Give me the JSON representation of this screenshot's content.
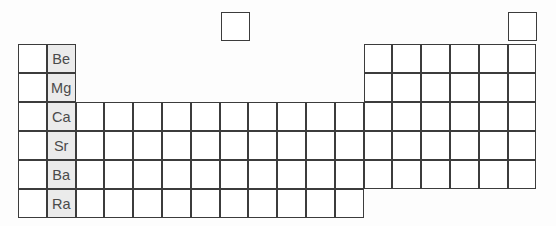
{
  "figure": {
    "kind": "periodic-table-outline",
    "highlighted_group": "Group 2 (alkaline earth metals)",
    "columns": 18,
    "rows": 7
  },
  "geometry": {
    "origin_x": 18,
    "origin_y": 44,
    "cell_w": 28.8,
    "cell_h": 29,
    "hydrogen_x": 221,
    "hydrogen_y": 12,
    "helium_x": 508,
    "helium_y": 12
  },
  "cells": [
    {
      "name": "hydrogen-cell",
      "col": 1,
      "row": 0,
      "x": 221,
      "y": 12,
      "symbol": "",
      "shaded": false
    },
    {
      "name": "helium-cell",
      "col": 18,
      "row": 0,
      "x": 508,
      "y": 12,
      "symbol": "",
      "shaded": false
    },
    {
      "name": "group1-period2",
      "col": 1,
      "row": 1,
      "symbol": "",
      "shaded": false
    },
    {
      "name": "group2-period2",
      "col": 2,
      "row": 1,
      "symbol": "Be",
      "shaded": true
    },
    {
      "name": "group13-period2",
      "col": 13,
      "row": 1,
      "symbol": "",
      "shaded": false
    },
    {
      "name": "group14-period2",
      "col": 14,
      "row": 1,
      "symbol": "",
      "shaded": false
    },
    {
      "name": "group15-period2",
      "col": 15,
      "row": 1,
      "symbol": "",
      "shaded": false
    },
    {
      "name": "group16-period2",
      "col": 16,
      "row": 1,
      "symbol": "",
      "shaded": false
    },
    {
      "name": "group17-period2",
      "col": 17,
      "row": 1,
      "symbol": "",
      "shaded": false
    },
    {
      "name": "group18-period2",
      "col": 18,
      "row": 1,
      "symbol": "",
      "shaded": false
    },
    {
      "name": "group1-period3",
      "col": 1,
      "row": 2,
      "symbol": "",
      "shaded": false
    },
    {
      "name": "group2-period3",
      "col": 2,
      "row": 2,
      "symbol": "Mg",
      "shaded": true
    },
    {
      "name": "group13-period3",
      "col": 13,
      "row": 2,
      "symbol": "",
      "shaded": false
    },
    {
      "name": "group14-period3",
      "col": 14,
      "row": 2,
      "symbol": "",
      "shaded": false
    },
    {
      "name": "group15-period3",
      "col": 15,
      "row": 2,
      "symbol": "",
      "shaded": false
    },
    {
      "name": "group16-period3",
      "col": 16,
      "row": 2,
      "symbol": "",
      "shaded": false
    },
    {
      "name": "group17-period3",
      "col": 17,
      "row": 2,
      "symbol": "",
      "shaded": false
    },
    {
      "name": "group18-period3",
      "col": 18,
      "row": 2,
      "symbol": "",
      "shaded": false
    },
    {
      "name": "group1-period4",
      "col": 1,
      "row": 3,
      "symbol": "",
      "shaded": false
    },
    {
      "name": "group2-period4",
      "col": 2,
      "row": 3,
      "symbol": "Ca",
      "shaded": true
    },
    {
      "name": "group3-period4",
      "col": 3,
      "row": 3,
      "symbol": "",
      "shaded": false
    },
    {
      "name": "group4-period4",
      "col": 4,
      "row": 3,
      "symbol": "",
      "shaded": false
    },
    {
      "name": "group5-period4",
      "col": 5,
      "row": 3,
      "symbol": "",
      "shaded": false
    },
    {
      "name": "group6-period4",
      "col": 6,
      "row": 3,
      "symbol": "",
      "shaded": false
    },
    {
      "name": "group7-period4",
      "col": 7,
      "row": 3,
      "symbol": "",
      "shaded": false
    },
    {
      "name": "group8-period4",
      "col": 8,
      "row": 3,
      "symbol": "",
      "shaded": false
    },
    {
      "name": "group9-period4",
      "col": 9,
      "row": 3,
      "symbol": "",
      "shaded": false
    },
    {
      "name": "group10-period4",
      "col": 10,
      "row": 3,
      "symbol": "",
      "shaded": false
    },
    {
      "name": "group11-period4",
      "col": 11,
      "row": 3,
      "symbol": "",
      "shaded": false
    },
    {
      "name": "group12-period4",
      "col": 12,
      "row": 3,
      "symbol": "",
      "shaded": false
    },
    {
      "name": "group13-period4",
      "col": 13,
      "row": 3,
      "symbol": "",
      "shaded": false
    },
    {
      "name": "group14-period4",
      "col": 14,
      "row": 3,
      "symbol": "",
      "shaded": false
    },
    {
      "name": "group15-period4",
      "col": 15,
      "row": 3,
      "symbol": "",
      "shaded": false
    },
    {
      "name": "group16-period4",
      "col": 16,
      "row": 3,
      "symbol": "",
      "shaded": false
    },
    {
      "name": "group17-period4",
      "col": 17,
      "row": 3,
      "symbol": "",
      "shaded": false
    },
    {
      "name": "group18-period4",
      "col": 18,
      "row": 3,
      "symbol": "",
      "shaded": false
    },
    {
      "name": "group1-period5",
      "col": 1,
      "row": 4,
      "symbol": "",
      "shaded": false
    },
    {
      "name": "group2-period5",
      "col": 2,
      "row": 4,
      "symbol": "Sr",
      "shaded": true
    },
    {
      "name": "group3-period5",
      "col": 3,
      "row": 4,
      "symbol": "",
      "shaded": false
    },
    {
      "name": "group4-period5",
      "col": 4,
      "row": 4,
      "symbol": "",
      "shaded": false
    },
    {
      "name": "group5-period5",
      "col": 5,
      "row": 4,
      "symbol": "",
      "shaded": false
    },
    {
      "name": "group6-period5",
      "col": 6,
      "row": 4,
      "symbol": "",
      "shaded": false
    },
    {
      "name": "group7-period5",
      "col": 7,
      "row": 4,
      "symbol": "",
      "shaded": false
    },
    {
      "name": "group8-period5",
      "col": 8,
      "row": 4,
      "symbol": "",
      "shaded": false
    },
    {
      "name": "group9-period5",
      "col": 9,
      "row": 4,
      "symbol": "",
      "shaded": false
    },
    {
      "name": "group10-period5",
      "col": 10,
      "row": 4,
      "symbol": "",
      "shaded": false
    },
    {
      "name": "group11-period5",
      "col": 11,
      "row": 4,
      "symbol": "",
      "shaded": false
    },
    {
      "name": "group12-period5",
      "col": 12,
      "row": 4,
      "symbol": "",
      "shaded": false
    },
    {
      "name": "group13-period5",
      "col": 13,
      "row": 4,
      "symbol": "",
      "shaded": false
    },
    {
      "name": "group14-period5",
      "col": 14,
      "row": 4,
      "symbol": "",
      "shaded": false
    },
    {
      "name": "group15-period5",
      "col": 15,
      "row": 4,
      "symbol": "",
      "shaded": false
    },
    {
      "name": "group16-period5",
      "col": 16,
      "row": 4,
      "symbol": "",
      "shaded": false
    },
    {
      "name": "group17-period5",
      "col": 17,
      "row": 4,
      "symbol": "",
      "shaded": false
    },
    {
      "name": "group18-period5",
      "col": 18,
      "row": 4,
      "symbol": "",
      "shaded": false
    },
    {
      "name": "group1-period6",
      "col": 1,
      "row": 5,
      "symbol": "",
      "shaded": false
    },
    {
      "name": "group2-period6",
      "col": 2,
      "row": 5,
      "symbol": "Ba",
      "shaded": true
    },
    {
      "name": "group3-period6",
      "col": 3,
      "row": 5,
      "symbol": "",
      "shaded": false
    },
    {
      "name": "group4-period6",
      "col": 4,
      "row": 5,
      "symbol": "",
      "shaded": false
    },
    {
      "name": "group5-period6",
      "col": 5,
      "row": 5,
      "symbol": "",
      "shaded": false
    },
    {
      "name": "group6-period6",
      "col": 6,
      "row": 5,
      "symbol": "",
      "shaded": false
    },
    {
      "name": "group7-period6",
      "col": 7,
      "row": 5,
      "symbol": "",
      "shaded": false
    },
    {
      "name": "group8-period6",
      "col": 8,
      "row": 5,
      "symbol": "",
      "shaded": false
    },
    {
      "name": "group9-period6",
      "col": 9,
      "row": 5,
      "symbol": "",
      "shaded": false
    },
    {
      "name": "group10-period6",
      "col": 10,
      "row": 5,
      "symbol": "",
      "shaded": false
    },
    {
      "name": "group11-period6",
      "col": 11,
      "row": 5,
      "symbol": "",
      "shaded": false
    },
    {
      "name": "group12-period6",
      "col": 12,
      "row": 5,
      "symbol": "",
      "shaded": false
    },
    {
      "name": "group13-period6",
      "col": 13,
      "row": 5,
      "symbol": "",
      "shaded": false
    },
    {
      "name": "group14-period6",
      "col": 14,
      "row": 5,
      "symbol": "",
      "shaded": false
    },
    {
      "name": "group15-period6",
      "col": 15,
      "row": 5,
      "symbol": "",
      "shaded": false
    },
    {
      "name": "group16-period6",
      "col": 16,
      "row": 5,
      "symbol": "",
      "shaded": false
    },
    {
      "name": "group17-period6",
      "col": 17,
      "row": 5,
      "symbol": "",
      "shaded": false
    },
    {
      "name": "group18-period6",
      "col": 18,
      "row": 5,
      "symbol": "",
      "shaded": false
    },
    {
      "name": "group1-period7",
      "col": 1,
      "row": 6,
      "symbol": "",
      "shaded": false
    },
    {
      "name": "group2-period7",
      "col": 2,
      "row": 6,
      "symbol": "Ra",
      "shaded": true
    },
    {
      "name": "group3-period7",
      "col": 3,
      "row": 6,
      "symbol": "",
      "shaded": false
    },
    {
      "name": "group4-period7",
      "col": 4,
      "row": 6,
      "symbol": "",
      "shaded": false
    },
    {
      "name": "group5-period7",
      "col": 5,
      "row": 6,
      "symbol": "",
      "shaded": false
    },
    {
      "name": "group6-period7",
      "col": 6,
      "row": 6,
      "symbol": "",
      "shaded": false
    },
    {
      "name": "group7-period7",
      "col": 7,
      "row": 6,
      "symbol": "",
      "shaded": false
    },
    {
      "name": "group8-period7",
      "col": 8,
      "row": 6,
      "symbol": "",
      "shaded": false
    },
    {
      "name": "group9-period7",
      "col": 9,
      "row": 6,
      "symbol": "",
      "shaded": false
    },
    {
      "name": "group10-period7",
      "col": 10,
      "row": 6,
      "symbol": "",
      "shaded": false
    },
    {
      "name": "group11-period7",
      "col": 11,
      "row": 6,
      "symbol": "",
      "shaded": false
    },
    {
      "name": "group12-period7",
      "col": 12,
      "row": 6,
      "symbol": "",
      "shaded": false
    }
  ],
  "colors": {
    "border": "#3c3c3c",
    "cell_fill": "#ffffff",
    "shaded_fill": "#ebebeb",
    "symbol_text": "#4a4a4a",
    "page_background": "#fdfdfd"
  }
}
